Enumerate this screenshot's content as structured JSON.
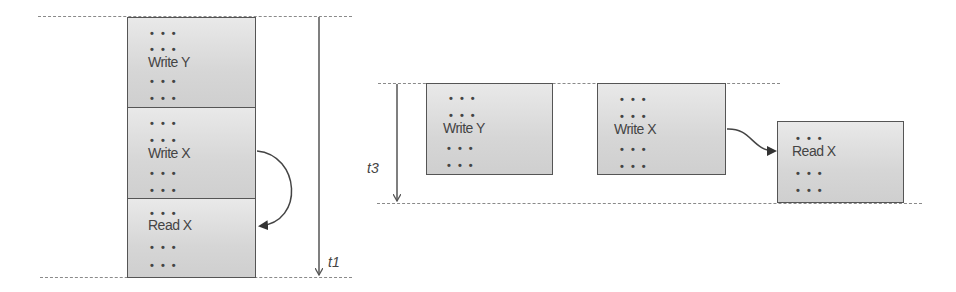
{
  "left_panel": {
    "time_label": "t1",
    "boxes": [
      {
        "label": "Write Y",
        "dots": "• • •"
      },
      {
        "label": "Write X",
        "dots": "• • •"
      },
      {
        "label": "Read X",
        "dots": "• • •"
      }
    ]
  },
  "right_panel": {
    "time_label": "t3",
    "boxes": [
      {
        "label": "Write Y",
        "dots": "• • •"
      },
      {
        "label": "Write X",
        "dots": "• • •"
      },
      {
        "label": "Read X",
        "dots": "• • •"
      }
    ]
  },
  "colors": {
    "box_fill": "#d9d9d9",
    "box_border": "#555555",
    "line": "#555555",
    "dash": "#8a8a8a"
  }
}
